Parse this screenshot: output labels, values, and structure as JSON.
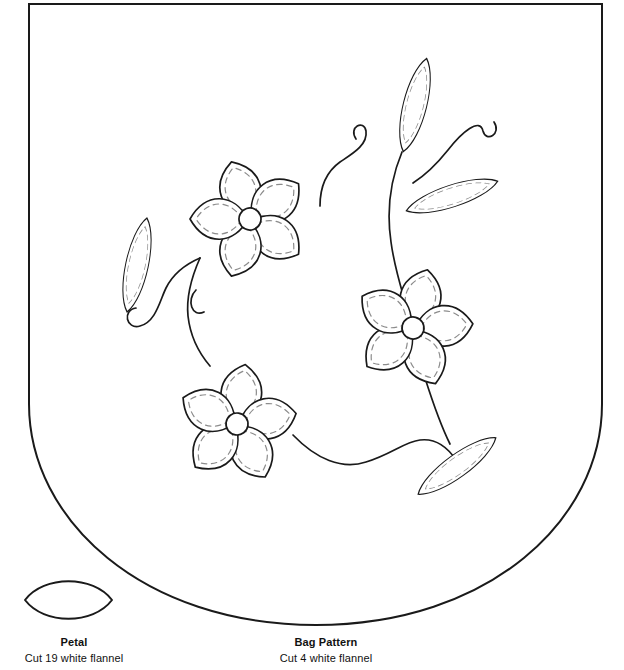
{
  "document": {
    "kind": "sewing-pattern-sheet",
    "background_color": "#ffffff",
    "ink_color": "#1a1a1a",
    "stitch_color": "#8c8c8c",
    "width": 624,
    "height": 670
  },
  "pieces": [
    {
      "id": "petal",
      "title": "Petal",
      "instruction": "Cut 19 white flannel",
      "shape": "pointed-oval-lens"
    },
    {
      "id": "bag",
      "title": "Bag Pattern",
      "instruction": "Cut 4 white flannel",
      "shape": "rounded-bottom-rectangle"
    }
  ],
  "petal_piece": {
    "title": "Petal",
    "instruction": "Cut 19 white flannel"
  },
  "bag_piece": {
    "title": "Bag Pattern",
    "instruction": "Cut 4 white flannel"
  },
  "applique_design": {
    "name": "floral-vine-applique",
    "flowers": [
      {
        "id": "flower-top-left",
        "center_x": 250,
        "center_y": 219,
        "petal_count": 5,
        "center_radius": 11,
        "rotation_deg": -18
      },
      {
        "id": "flower-right",
        "center_x": 413,
        "center_y": 328,
        "petal_count": 5,
        "center_radius": 11,
        "rotation_deg": 14
      },
      {
        "id": "flower-bottom-left",
        "center_x": 237,
        "center_y": 424,
        "petal_count": 5,
        "center_radius": 11,
        "rotation_deg": 8
      }
    ],
    "leaves": [
      {
        "id": "leaf-top",
        "center_x": 415,
        "center_y": 105,
        "rx": 28,
        "ry": 47,
        "rotation_deg": 18
      },
      {
        "id": "leaf-upper-right",
        "center_x": 450,
        "center_y": 195,
        "rx": 48,
        "ry": 26,
        "rotation_deg": -16
      },
      {
        "id": "leaf-left",
        "center_x": 137,
        "center_y": 265,
        "rx": 26,
        "ry": 42,
        "rotation_deg": 12
      },
      {
        "id": "leaf-lower-right",
        "center_x": 457,
        "center_y": 466,
        "rx": 44,
        "ry": 26,
        "rotation_deg": -34
      }
    ],
    "tendrils": [
      {
        "id": "tendril-upper-left-curl"
      },
      {
        "id": "tendril-upper-right-curl"
      },
      {
        "id": "tendril-left-pair"
      },
      {
        "id": "stem-main-right"
      },
      {
        "id": "stem-wavy-bottom"
      }
    ],
    "stitch_style": "dashed-inner-outline"
  }
}
